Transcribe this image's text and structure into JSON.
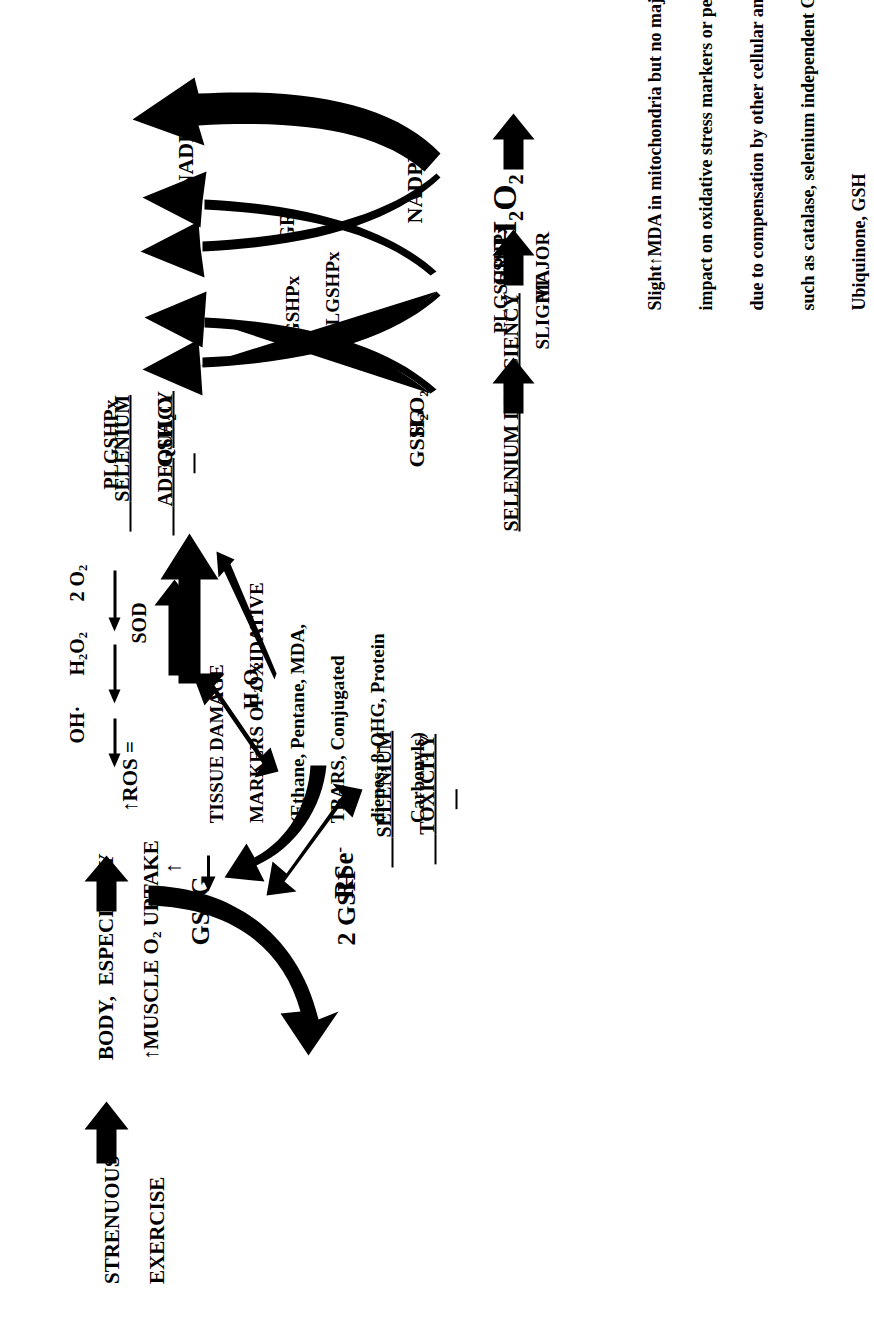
{
  "figure": {
    "orientation_deg": -90,
    "background": "#ffffff",
    "ink": "#000000"
  },
  "exercise_branch": {
    "source_label_line1": "STRENUOUS",
    "source_label_line2": "EXERCISE",
    "uptake_line1": "BODY,  ESPECIALLY",
    "uptake_line2": "MUSCLE O",
    "uptake_line2_sub": "2",
    "uptake_line2_tail": " UPTAKE",
    "uptake_arrow_up": "↑",
    "ros_label": "ROS =",
    "ros_arrow_up": "↑",
    "ros_species": [
      {
        "text": "OH",
        "sub": "",
        "tail": "·",
        "arrow": "↑"
      },
      {
        "text": "H",
        "sub": "2",
        "mid": "O",
        "sub2": "2",
        "arrow": "↑"
      },
      {
        "text": "2 O",
        "sub": "2",
        "arrow": "↑"
      }
    ],
    "sod_label": "SOD",
    "h2o2_label": "H₂O₂"
  },
  "tissue_damage": {
    "arrow_up": "↑",
    "line1": "TISSUE DAMAGE",
    "line2": "MARKERS OF OXIDATIVE",
    "line3": "(Ethane, Pentane, MDA,",
    "line4": "TBARS, Conjugated",
    "line5": "dienes, 8-OHG, Protein",
    "line6": "Carbonyls)"
  },
  "selenium_toxicity": {
    "heading_line1": "SELENIUM",
    "heading_line2": "TOXICITY",
    "rse_label": "RSe",
    "rse_sup": "-",
    "gssg_label": "GSSG",
    "gsh_label": "2 GSH"
  },
  "selenium_adequacy": {
    "heading_line1": "SELENIUM",
    "heading_line2": "ADEQUACY",
    "enzyme_top": "PLGSHPx",
    "cycle1": {
      "substrate_in": "H₂O₂",
      "product_out": "H₂O",
      "cosubstrate_in": "GSH",
      "cosubstrate_out": "GSSG",
      "enzyme_line1": "GSHPx",
      "enzyme_line2": "PLGSHPx"
    },
    "cycle2": {
      "cosubstrate_in": "NADPH",
      "cosubstrate_out": "NADP",
      "cosubstrate_out_sup": "+",
      "enzyme": "GR"
    }
  },
  "selenium_deficiency": {
    "heading": "SELENIUM DEFICIENCY",
    "step1_label": "SLIGHT",
    "step1_arrow_down": "↓",
    "step1_enzyme": "PLGSHPx",
    "step2_label": "MAJOR",
    "step2_arrow_down": "↓",
    "step2_enzyme": "GSHPx",
    "product": "H₂O₂"
  },
  "outcome_caption": {
    "line1_a": "Slight",
    "line1_arrow": "↑",
    "line1_b": "MDA in mitochondria but no major",
    "line2": "impact on oxidative stress markers or performance",
    "line3": "due to compensation by other cellular antioxidants",
    "line4": "such as catalase, selenium independent GSHPx, Vitamin E, C,",
    "line5": "Ubiquinone, GSH"
  }
}
